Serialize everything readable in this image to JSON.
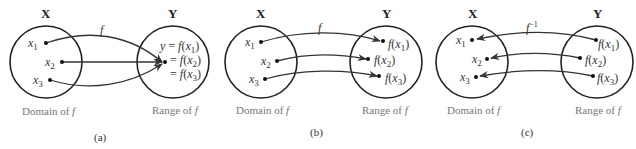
{
  "panels": [
    {
      "caption": "(a)",
      "set_x_label": "X",
      "set_y_label": "Y",
      "arrow_label": "f",
      "domain_label": "Domain of f",
      "range_label": "Range of f",
      "x_points": [
        "x1",
        "x2",
        "x3"
      ],
      "y_points": [
        "y = f(x1)",
        "= f(x2)",
        "= f(x3)"
      ],
      "mapping": "many-to-one"
    },
    {
      "caption": "(b)",
      "set_x_label": "X",
      "set_y_label": "Y",
      "arrow_label": "f",
      "domain_label": "Domain of f",
      "range_label": "Range of f",
      "x_points": [
        "x1",
        "x2",
        "x3"
      ],
      "y_points": [
        "f(x1)",
        "f(x2)",
        "f(x3)"
      ],
      "mapping": "one-to-one"
    },
    {
      "caption": "(c)",
      "set_x_label": "X",
      "set_y_label": "Y",
      "arrow_label": "f^-1",
      "domain_label": "Domain of f",
      "range_label": "Range of f",
      "x_points": [
        "x1",
        "x2",
        "x3"
      ],
      "y_points": [
        "f(x1)",
        "f(x2)",
        "f(x3)"
      ],
      "mapping": "inverse"
    }
  ],
  "text": {
    "X": "X",
    "Y": "Y",
    "f": "f",
    "finv": "f",
    "finv_sup": "−1",
    "x": "x",
    "y_eq": "y = ",
    "eq": "= ",
    "sub1": "1",
    "sub2": "2",
    "sub3": "3",
    "f_open": "f(",
    "close": ")",
    "domain_prefix": "Domain of ",
    "range_prefix": "Range of ",
    "cap_a": "(a)",
    "cap_b": "(b)",
    "cap_c": "(c)"
  }
}
